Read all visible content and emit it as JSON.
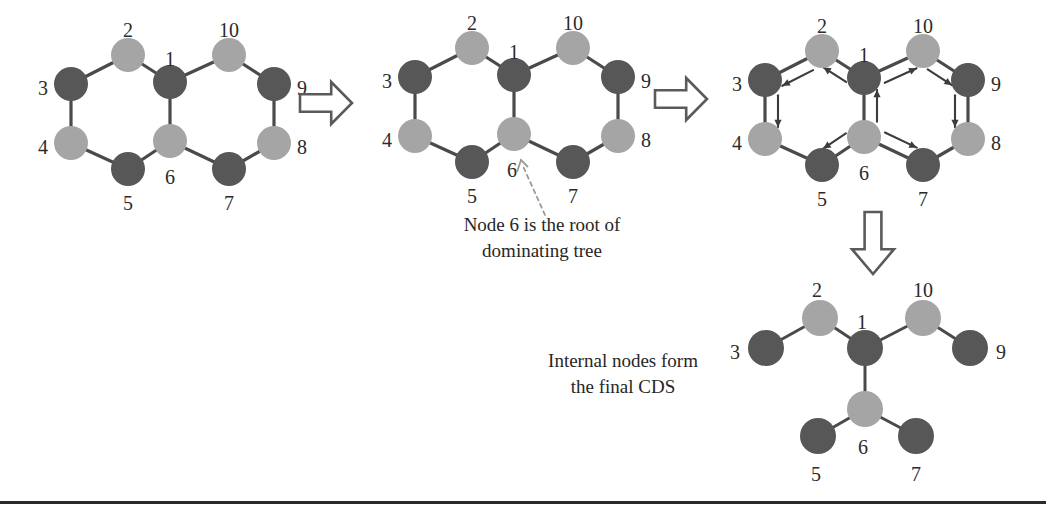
{
  "figure": {
    "background_color": "#ffffff",
    "node_colors": {
      "dominator_dark": "#575757",
      "dominatee_light": "#a5a5a5"
    },
    "edge_color": "#4a4a4a",
    "arrow_color": "#3c3c3c"
  },
  "captions": {
    "root": "Node 6 is the root of\ndominating tree",
    "cds": "Internal nodes form\nthe final CDS"
  },
  "stage_arrows": [
    {
      "name": "stage-arrow-1-to-2",
      "direction": "right",
      "x": 300,
      "y": 82,
      "w": 52,
      "h": 42
    },
    {
      "name": "stage-arrow-2-to-3",
      "direction": "right",
      "x": 655,
      "y": 78,
      "w": 52,
      "h": 42
    },
    {
      "name": "stage-arrow-3-to-4",
      "direction": "down",
      "x": 852,
      "y": 212,
      "w": 42,
      "h": 62
    }
  ],
  "panels": [
    {
      "id": "panel-1",
      "name": "initial-graph",
      "nodes": [
        {
          "id": "1",
          "label": "1",
          "x": 170,
          "y": 82,
          "r": 17,
          "color": "dark",
          "label_dx": 0,
          "label_dy": -21
        },
        {
          "id": "2",
          "label": "2",
          "x": 128,
          "y": 55,
          "r": 17,
          "color": "light",
          "label_dx": 0,
          "label_dy": -23
        },
        {
          "id": "3",
          "label": "3",
          "x": 71,
          "y": 84,
          "r": 17,
          "color": "dark",
          "label_dx": -28,
          "label_dy": 6
        },
        {
          "id": "4",
          "label": "4",
          "x": 71,
          "y": 143,
          "r": 17,
          "color": "light",
          "label_dx": -28,
          "label_dy": 6
        },
        {
          "id": "5",
          "label": "5",
          "x": 128,
          "y": 169,
          "r": 17,
          "color": "dark",
          "label_dx": 0,
          "label_dy": 36
        },
        {
          "id": "6",
          "label": "6",
          "x": 170,
          "y": 141,
          "r": 17,
          "color": "light",
          "label_dx": 0,
          "label_dy": 38
        },
        {
          "id": "7",
          "label": "7",
          "x": 229,
          "y": 169,
          "r": 17,
          "color": "dark",
          "label_dx": 0,
          "label_dy": 36
        },
        {
          "id": "8",
          "label": "8",
          "x": 274,
          "y": 143,
          "r": 17,
          "color": "light",
          "label_dx": 28,
          "label_dy": 6
        },
        {
          "id": "9",
          "label": "9",
          "x": 274,
          "y": 84,
          "r": 17,
          "color": "dark",
          "label_dx": 28,
          "label_dy": 6
        },
        {
          "id": "10",
          "label": "10",
          "x": 229,
          "y": 55,
          "r": 17,
          "color": "light",
          "label_dx": 0,
          "label_dy": -23
        }
      ],
      "edges": [
        [
          "1",
          "2"
        ],
        [
          "2",
          "3"
        ],
        [
          "3",
          "4"
        ],
        [
          "4",
          "5"
        ],
        [
          "5",
          "6"
        ],
        [
          "6",
          "1"
        ],
        [
          "1",
          "10"
        ],
        [
          "10",
          "9"
        ],
        [
          "9",
          "8"
        ],
        [
          "8",
          "7"
        ],
        [
          "7",
          "6"
        ]
      ],
      "directed": []
    },
    {
      "id": "panel-2",
      "name": "rooted-graph",
      "nodes": [
        {
          "id": "1",
          "label": "1",
          "x": 514,
          "y": 75,
          "r": 17,
          "color": "dark",
          "label_dx": 0,
          "label_dy": -21
        },
        {
          "id": "2",
          "label": "2",
          "x": 472,
          "y": 48,
          "r": 17,
          "color": "light",
          "label_dx": 0,
          "label_dy": -23
        },
        {
          "id": "3",
          "label": "3",
          "x": 415,
          "y": 77,
          "r": 17,
          "color": "dark",
          "label_dx": -28,
          "label_dy": 6
        },
        {
          "id": "4",
          "label": "4",
          "x": 415,
          "y": 136,
          "r": 17,
          "color": "light",
          "label_dx": -28,
          "label_dy": 6
        },
        {
          "id": "5",
          "label": "5",
          "x": 472,
          "y": 162,
          "r": 17,
          "color": "dark",
          "label_dx": 0,
          "label_dy": 36
        },
        {
          "id": "6",
          "label": "6",
          "x": 514,
          "y": 134,
          "r": 17,
          "color": "light",
          "label_dx": -2,
          "label_dy": 38
        },
        {
          "id": "7",
          "label": "7",
          "x": 573,
          "y": 162,
          "r": 17,
          "color": "dark",
          "label_dx": 0,
          "label_dy": 36
        },
        {
          "id": "8",
          "label": "8",
          "x": 618,
          "y": 136,
          "r": 17,
          "color": "light",
          "label_dx": 28,
          "label_dy": 6
        },
        {
          "id": "9",
          "label": "9",
          "x": 618,
          "y": 77,
          "r": 17,
          "color": "dark",
          "label_dx": 28,
          "label_dy": 6
        },
        {
          "id": "10",
          "label": "10",
          "x": 573,
          "y": 48,
          "r": 17,
          "color": "light",
          "label_dx": 0,
          "label_dy": -23
        }
      ],
      "edges": [
        [
          "1",
          "2"
        ],
        [
          "2",
          "3"
        ],
        [
          "3",
          "4"
        ],
        [
          "4",
          "5"
        ],
        [
          "5",
          "6"
        ],
        [
          "6",
          "1"
        ],
        [
          "1",
          "10"
        ],
        [
          "10",
          "9"
        ],
        [
          "9",
          "8"
        ],
        [
          "8",
          "7"
        ],
        [
          "7",
          "6"
        ]
      ],
      "directed": []
    },
    {
      "id": "panel-3",
      "name": "dominating-tree-graph",
      "nodes": [
        {
          "id": "1",
          "label": "1",
          "x": 864,
          "y": 78,
          "r": 17,
          "color": "dark",
          "label_dx": 0,
          "label_dy": -21
        },
        {
          "id": "2",
          "label": "2",
          "x": 822,
          "y": 51,
          "r": 17,
          "color": "light",
          "label_dx": 0,
          "label_dy": -23
        },
        {
          "id": "3",
          "label": "3",
          "x": 765,
          "y": 80,
          "r": 17,
          "color": "dark",
          "label_dx": -28,
          "label_dy": 6
        },
        {
          "id": "4",
          "label": "4",
          "x": 765,
          "y": 139,
          "r": 17,
          "color": "light",
          "label_dx": -28,
          "label_dy": 6
        },
        {
          "id": "5",
          "label": "5",
          "x": 822,
          "y": 165,
          "r": 17,
          "color": "dark",
          "label_dx": 0,
          "label_dy": 36
        },
        {
          "id": "6",
          "label": "6",
          "x": 864,
          "y": 137,
          "r": 17,
          "color": "light",
          "label_dx": 0,
          "label_dy": 38
        },
        {
          "id": "7",
          "label": "7",
          "x": 923,
          "y": 165,
          "r": 17,
          "color": "dark",
          "label_dx": 0,
          "label_dy": 36
        },
        {
          "id": "8",
          "label": "8",
          "x": 968,
          "y": 139,
          "r": 17,
          "color": "light",
          "label_dx": 28,
          "label_dy": 6
        },
        {
          "id": "9",
          "label": "9",
          "x": 968,
          "y": 80,
          "r": 17,
          "color": "dark",
          "label_dx": 28,
          "label_dy": 6
        },
        {
          "id": "10",
          "label": "10",
          "x": 923,
          "y": 51,
          "r": 17,
          "color": "light",
          "label_dx": 0,
          "label_dy": -23
        }
      ],
      "edges": [
        [
          "1",
          "2"
        ],
        [
          "2",
          "3"
        ],
        [
          "3",
          "4"
        ],
        [
          "4",
          "5"
        ],
        [
          "5",
          "6"
        ],
        [
          "6",
          "1"
        ],
        [
          "1",
          "10"
        ],
        [
          "10",
          "9"
        ],
        [
          "9",
          "8"
        ],
        [
          "8",
          "7"
        ],
        [
          "7",
          "6"
        ]
      ],
      "directed": [
        {
          "from": "6",
          "to": "1",
          "name": "arrow-6-to-1"
        },
        {
          "from": "1",
          "to": "2",
          "name": "arrow-1-to-2"
        },
        {
          "from": "2",
          "to": "3",
          "name": "arrow-2-to-3"
        },
        {
          "from": "3",
          "to": "4",
          "name": "arrow-3-to-4"
        },
        {
          "from": "6",
          "to": "5",
          "name": "arrow-6-to-5"
        },
        {
          "from": "1",
          "to": "10",
          "name": "arrow-1-to-10"
        },
        {
          "from": "10",
          "to": "9",
          "name": "arrow-10-to-9"
        },
        {
          "from": "9",
          "to": "8",
          "name": "arrow-9-to-8"
        },
        {
          "from": "6",
          "to": "7",
          "name": "arrow-6-to-7"
        }
      ]
    },
    {
      "id": "panel-4",
      "name": "final-cds-tree",
      "nodes": [
        {
          "id": "1",
          "label": "1",
          "x": 865,
          "y": 348,
          "r": 18,
          "color": "dark",
          "label_dx": -3,
          "label_dy": -24
        },
        {
          "id": "2",
          "label": "2",
          "x": 820,
          "y": 318,
          "r": 18,
          "color": "light",
          "label_dx": -3,
          "label_dy": -26
        },
        {
          "id": "3",
          "label": "3",
          "x": 766,
          "y": 348,
          "r": 18,
          "color": "dark",
          "label_dx": -31,
          "label_dy": 6
        },
        {
          "id": "10",
          "label": "10",
          "x": 923,
          "y": 318,
          "r": 18,
          "color": "light",
          "label_dx": 0,
          "label_dy": -26
        },
        {
          "id": "9",
          "label": "9",
          "x": 970,
          "y": 348,
          "r": 18,
          "color": "dark",
          "label_dx": 31,
          "label_dy": 6
        },
        {
          "id": "6",
          "label": "6",
          "x": 865,
          "y": 409,
          "r": 18,
          "color": "light",
          "label_dx": -2,
          "label_dy": 40
        },
        {
          "id": "5",
          "label": "5",
          "x": 818,
          "y": 436,
          "r": 18,
          "color": "dark",
          "label_dx": -2,
          "label_dy": 40
        },
        {
          "id": "7",
          "label": "7",
          "x": 916,
          "y": 436,
          "r": 18,
          "color": "dark",
          "label_dx": 0,
          "label_dy": 40
        }
      ],
      "edges": [
        [
          "1",
          "2"
        ],
        [
          "2",
          "3"
        ],
        [
          "1",
          "10"
        ],
        [
          "10",
          "9"
        ],
        [
          "1",
          "6"
        ],
        [
          "6",
          "5"
        ],
        [
          "6",
          "7"
        ]
      ],
      "directed": []
    }
  ],
  "pointer": {
    "name": "root-pointer",
    "from_x": 545,
    "from_y": 215,
    "to_x": 521,
    "to_y": 160
  },
  "footer_rule": {
    "name": "footer-rule",
    "color": "#2a2a2a"
  }
}
